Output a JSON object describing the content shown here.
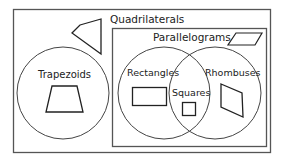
{
  "diagram": {
    "title": "Quadrilaterals",
    "sets": {
      "parallelograms": "Parallelograms",
      "trapezoids": "Trapezoids",
      "rectangles": "Rectangles",
      "rhombuses": "Rhombuses",
      "squares": "Squares"
    },
    "colors": {
      "stroke": "#333333",
      "background": "#ffffff"
    }
  }
}
